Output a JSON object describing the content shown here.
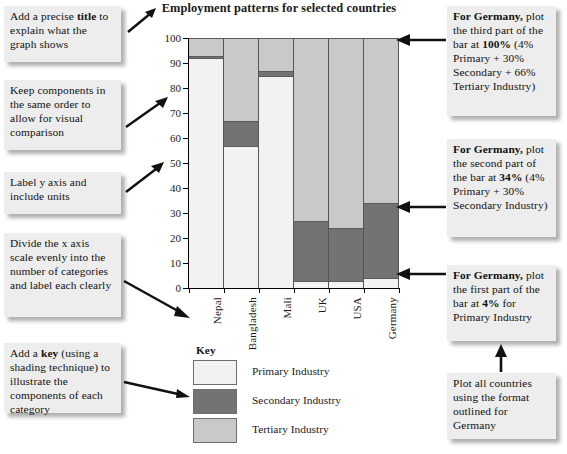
{
  "chart_data": {
    "type": "bar",
    "subtype": "stacked-bar-100",
    "title": "Employment patterns for selected countries",
    "xlabel": "",
    "ylabel": "% Population",
    "ylim": [
      0,
      100
    ],
    "yticks": [
      0,
      10,
      20,
      30,
      40,
      50,
      60,
      70,
      80,
      90,
      100
    ],
    "ytick_labels": [
      "0",
      "10",
      "20",
      "30",
      "40",
      "50",
      "60",
      "70",
      "80",
      "90",
      "100"
    ],
    "grid": false,
    "legend_position": "below-left",
    "legend_title": "Key",
    "categories": [
      "Nepal",
      "Bangladesh",
      "Mali",
      "UK",
      "USA",
      "Germany"
    ],
    "series": [
      {
        "name": "Primary Industry",
        "color": "#f2f2f2",
        "values": [
          92,
          57,
          85,
          3,
          3,
          4
        ]
      },
      {
        "name": "Secondary Industry",
        "color": "#737373",
        "values": [
          1,
          10,
          2,
          24,
          21,
          30
        ]
      },
      {
        "name": "Tertiary Industry",
        "color": "#c9c9c9",
        "values": [
          7,
          33,
          13,
          73,
          76,
          66
        ]
      }
    ],
    "cumulative_tops": {
      "Nepal": [
        92,
        93,
        100
      ],
      "Bangladesh": [
        57,
        67,
        100
      ],
      "Mali": [
        85,
        87,
        100
      ],
      "UK": [
        3,
        27,
        100
      ],
      "USA": [
        3,
        24,
        100
      ],
      "Germany": [
        4,
        34,
        100
      ]
    }
  },
  "notes": {
    "title_note": {
      "lines": [
        "Add a precise ",
        "title",
        " to explain what the graph shows"
      ],
      "text": "Add a precise title to explain what the graph shows",
      "bold": "title"
    },
    "order_note": {
      "text": "Keep components in the same order to allow for visual comparison"
    },
    "yaxis_note": {
      "text": "Label y axis and include units"
    },
    "xaxis_note": {
      "text": "Divide the x axis scale evenly into the number of categories and label each clearly"
    },
    "key_note": {
      "text": "Add a key (using a shading technique) to illustrate the components of each category",
      "bold": "key"
    },
    "germany_third": {
      "head": "For Germany,",
      "text": "plot the third part of the bar at 100% (4% Primary + 30% Secondary + 66% Tertiary Industry)",
      "bold_value": "100%"
    },
    "germany_second": {
      "head": "For Germany,",
      "text": "plot the second part of the bar at 34% (4% Primary + 30% Secondary Industry)",
      "bold_value": "34%"
    },
    "germany_first": {
      "head": "For Germany,",
      "text": "plot the first part of the bar at 4% for Primary Industry",
      "bold_value": "4%"
    },
    "all_countries": {
      "text": "Plot all countries using the format outlined for Germany"
    }
  }
}
